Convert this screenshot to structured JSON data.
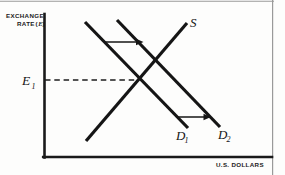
{
  "figure": {
    "kind": "supply-demand-diagram",
    "background_color": "#fdfdfc",
    "ink_color": "#141414",
    "frame_color": "#8b8b8b"
  },
  "axes": {
    "y_axis_label_line1": "EXCHANGE",
    "y_axis_label_line2": "RATE",
    "y_axis_label_symbol_open": "(",
    "y_axis_label_symbol": "E",
    "y_axis_label_symbol_close": ")",
    "x_axis_label": "U.S. DOLLARS",
    "origin_x": 44,
    "origin_y": 157,
    "y_axis_top": 14,
    "x_axis_right": 272
  },
  "equilibrium": {
    "label": "E",
    "subscript": "1",
    "dash_line_from_x": 44,
    "dash_line_to_x": 139,
    "dash_line_y": 80
  },
  "curves": [
    {
      "name": "supply",
      "label": "S",
      "subscript": "",
      "x1": 86,
      "y1": 141,
      "x2": 187,
      "y2": 23,
      "label_x": 190,
      "label_y": 26
    },
    {
      "name": "demand-initial",
      "label": "D",
      "subscript": "1",
      "x1": 85,
      "y1": 22,
      "x2": 188,
      "y2": 128,
      "label_x": 178,
      "label_y": 140
    },
    {
      "name": "demand-shifted",
      "label": "D",
      "subscript": "2",
      "x1": 117,
      "y1": 20,
      "x2": 220,
      "y2": 127,
      "label_x": 220,
      "label_y": 139
    }
  ],
  "shift_arrows": [
    {
      "name": "upper-shift-arrow",
      "x1": 105,
      "y1": 42,
      "x2": 143,
      "y2": 42
    },
    {
      "name": "lower-shift-arrow",
      "x1": 177,
      "y1": 117,
      "x2": 211,
      "y2": 117
    }
  ],
  "intersections": [
    {
      "name": "equilibrium-initial",
      "x": 139,
      "y": 80
    },
    {
      "name": "equilibrium-shifted",
      "x": 158,
      "y": 62
    }
  ]
}
